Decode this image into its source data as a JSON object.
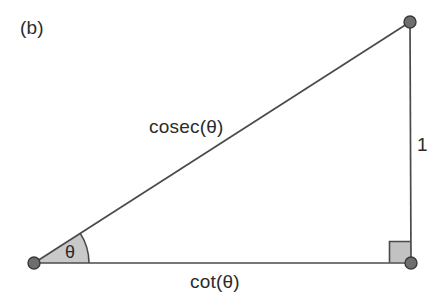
{
  "figure": {
    "panel_label": "(b)",
    "type": "right-triangle-trigonometric-identity",
    "labels": {
      "hypotenuse": "cosec(θ)",
      "base": "cot(θ)",
      "height": "1",
      "angle": "θ"
    },
    "geometry": {
      "vertex_left": [
        34,
        263
      ],
      "vertex_bottom_right": [
        411,
        263
      ],
      "vertex_top_right": [
        410,
        22
      ],
      "angle_arc_radius": 55,
      "angle_degrees": 32.6,
      "right_angle_marker_size": 21
    },
    "colors": {
      "stroke": "#4a4a4a",
      "fill_sector": "#c9c9c9",
      "fill_right_angle": "#c2c2c2",
      "vertex_dot": "#6e6e6e",
      "vertex_dot_stroke": "#3a3a3a",
      "text": "#2b2b2b",
      "background": "#ffffff"
    }
  }
}
